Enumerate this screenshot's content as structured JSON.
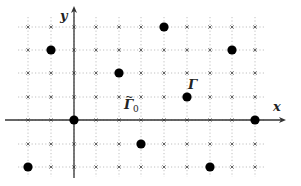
{
  "diagram": {
    "type": "lattice",
    "grid": {
      "x_pixels": [
        28,
        51,
        74,
        96,
        119,
        141,
        164,
        187,
        210,
        232,
        255
      ],
      "y_pixels": [
        27,
        50,
        73,
        97,
        120,
        144,
        167
      ],
      "x_values": [
        -2,
        -1,
        0,
        1,
        2,
        3,
        4,
        5,
        6,
        7,
        8
      ],
      "y_values": [
        4,
        3,
        2,
        1,
        0,
        -1,
        -2
      ],
      "marker": "×",
      "line_style": "dotted",
      "line_color": "#b0b0b0",
      "marker_color": "#555555"
    },
    "axes": {
      "x_label": "x",
      "y_label": "y",
      "origin_px": [
        74,
        120
      ],
      "x_range_px": [
        5,
        282
      ],
      "y_range_px": [
        178,
        10
      ],
      "color": "#333333"
    },
    "points": [
      {
        "x": 4,
        "y": 4
      },
      {
        "x": -1,
        "y": 3
      },
      {
        "x": 7,
        "y": 3
      },
      {
        "x": 2,
        "y": 2
      },
      {
        "x": 5,
        "y": 1
      },
      {
        "x": 0,
        "y": 0
      },
      {
        "x": 8,
        "y": 0
      },
      {
        "x": 3,
        "y": -1
      },
      {
        "x": -2,
        "y": -2
      },
      {
        "x": 6,
        "y": -2
      }
    ],
    "point_color": "#000000",
    "labels": {
      "gamma": "Γ",
      "gamma_tilde": "Γ",
      "gamma_tilde_sub": "0",
      "tilde": "~"
    }
  }
}
